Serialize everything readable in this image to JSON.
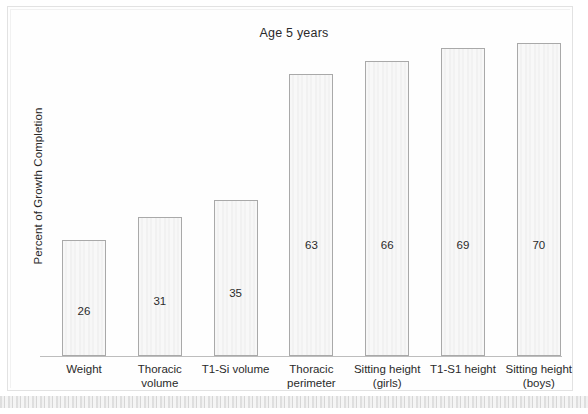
{
  "chart_data": {
    "type": "bar",
    "title": "Age 5 years",
    "xlabel": "",
    "ylabel": "Percent of Growth Completion",
    "ylim": [
      0,
      100
    ],
    "grid": false,
    "legend": "none",
    "categories": [
      "Weight",
      "Thoracic volume",
      "T1-Si volume",
      "Thoracic perimeter",
      "Sitting height (girls)",
      "T1-S1 height",
      "Sitting height (boys)"
    ],
    "values": [
      26,
      31,
      35,
      63,
      66,
      69,
      70
    ],
    "value_labels": [
      "26",
      "31",
      "35",
      "63",
      "66",
      "69",
      "70"
    ],
    "bars": [
      {
        "label_line1": "Weight",
        "label_line2": "",
        "value": 26,
        "value_label": "26"
      },
      {
        "label_line1": "Thoracic",
        "label_line2": "volume",
        "value": 31,
        "value_label": "31"
      },
      {
        "label_line1": "T1-Si volume",
        "label_line2": "",
        "value": 35,
        "value_label": "35"
      },
      {
        "label_line1": "Thoracic",
        "label_line2": "perimeter",
        "value": 63,
        "value_label": "63"
      },
      {
        "label_line1": "Sitting height",
        "label_line2": "(girls)",
        "value": 66,
        "value_label": "66"
      },
      {
        "label_line1": "T1-S1 height",
        "label_line2": "",
        "value": 69,
        "value_label": "69"
      },
      {
        "label_line1": "Sitting height",
        "label_line2": "(boys)",
        "value": 70,
        "value_label": "70"
      }
    ]
  },
  "style": {
    "bar_fill": "#f5f5f5",
    "bar_border": "#a9a9a9",
    "axis_color": "#bdbdbd",
    "text_color": "#2a2a2a",
    "page_background": "#ffffff"
  }
}
